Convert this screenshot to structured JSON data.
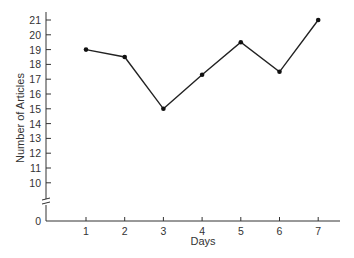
{
  "chart_data": {
    "type": "line",
    "title": "",
    "xlabel": "Days",
    "ylabel": "Number of Articles",
    "x": [
      1,
      2,
      3,
      4,
      5,
      6,
      7
    ],
    "categories": [
      "1",
      "2",
      "3",
      "4",
      "5",
      "6",
      "7"
    ],
    "values": [
      19,
      18.5,
      15,
      17.3,
      19.5,
      17.5,
      21
    ],
    "y_ticks": [
      "0",
      "10",
      "11",
      "12",
      "13",
      "14",
      "15",
      "16",
      "17",
      "18",
      "19",
      "20",
      "21"
    ],
    "ylim": [
      0,
      21
    ],
    "axis_break": "between 0 and 10",
    "grid": false,
    "legend": null,
    "markers": "dot"
  }
}
